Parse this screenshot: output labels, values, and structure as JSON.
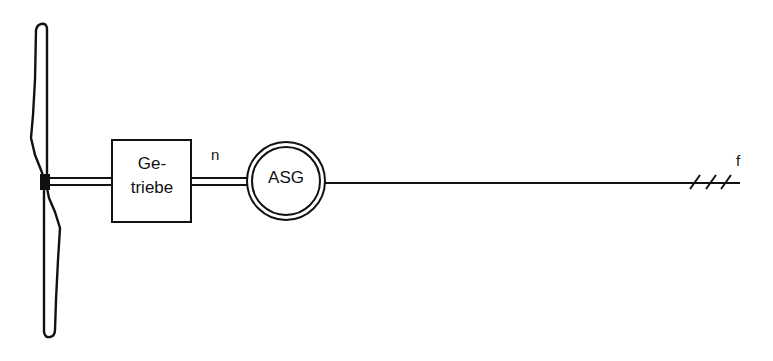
{
  "diagram": {
    "type": "wind turbine drivetrain schematic",
    "colors": {
      "stroke": "#111111",
      "background": "#ffffff"
    },
    "components": {
      "rotor": {
        "icon": "rotor-blade-icon"
      },
      "gearbox": {
        "line1": "Ge-",
        "line2": "triebe"
      },
      "shaft_speed": {
        "label": "n"
      },
      "generator": {
        "label": "ASG"
      },
      "grid": {
        "label": "f",
        "phases": 3
      }
    }
  }
}
